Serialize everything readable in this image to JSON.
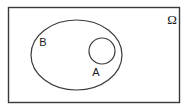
{
  "diagram": {
    "type": "venn-diagram",
    "background_color": "#ffffff",
    "stroke_color": "#3a3a3a",
    "text_color": "#1a1a1a",
    "universe": {
      "label": "Ω",
      "shape": "rectangle",
      "x": 8,
      "y": 7,
      "width": 172,
      "height": 96,
      "label_x": 172,
      "label_y": 24
    },
    "sets": [
      {
        "id": "B",
        "label": "B",
        "shape": "ellipse",
        "cx": 76.5,
        "cy": 55,
        "rx": 45.5,
        "ry": 35,
        "label_x": 43,
        "label_y": 46
      },
      {
        "id": "A",
        "label": "A",
        "shape": "circle",
        "cx": 102,
        "cy": 51,
        "r": 13,
        "label_x": 92,
        "label_y": 75
      }
    ]
  }
}
